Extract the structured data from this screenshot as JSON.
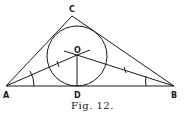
{
  "figure": {
    "caption": "Fig. 12.",
    "points": {
      "A": {
        "label": "A",
        "x": 6,
        "y": 86
      },
      "B": {
        "label": "B",
        "x": 174,
        "y": 86
      },
      "C": {
        "label": "C",
        "x": 72,
        "y": 16
      },
      "O": {
        "label": "O",
        "x": 77,
        "y": 55
      },
      "D": {
        "label": "D",
        "x": 77,
        "y": 86
      }
    },
    "incircle": {
      "cx": 77,
      "cy": 56,
      "r": 30
    },
    "colors": {
      "stroke": "#1a1a1a",
      "background": "#ffffff"
    }
  }
}
